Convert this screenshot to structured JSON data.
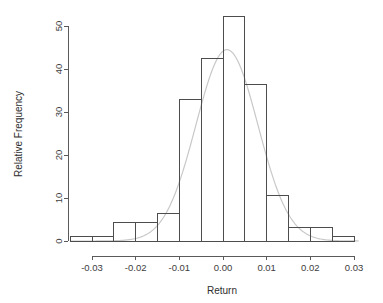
{
  "chart_data": {
    "type": "bar",
    "title": "",
    "subtitle": "",
    "xlabel": "Return",
    "ylabel": "Relative Frequency",
    "xlim": [
      -0.035,
      0.031
    ],
    "ylim": [
      0,
      52.5
    ],
    "grid": false,
    "legend": "none",
    "x_ticks": [
      -0.03,
      -0.02,
      -0.01,
      0.0,
      0.01,
      0.02,
      0.03
    ],
    "x_tick_labels": [
      "-0.03",
      "-0.02",
      "-0.01",
      "0.00",
      "0.01",
      "0.02",
      "0.03"
    ],
    "y_ticks": [
      0,
      10,
      20,
      30,
      40,
      50
    ],
    "y_tick_labels": [
      "0",
      "10",
      "20",
      "30",
      "40",
      "50"
    ],
    "bin_width": 0.005,
    "bin_edges": [
      -0.035,
      -0.03,
      -0.025,
      -0.02,
      -0.015,
      -0.01,
      -0.005,
      0.0,
      0.005,
      0.01,
      0.015,
      0.02,
      0.025,
      0.03
    ],
    "bin_centers": [
      -0.0325,
      -0.0275,
      -0.0225,
      -0.0175,
      -0.0125,
      -0.0075,
      -0.0025,
      0.0025,
      0.0075,
      0.0125,
      0.0175,
      0.0225,
      0.0275
    ],
    "values": [
      1.0,
      1.0,
      4.3,
      4.3,
      6.5,
      33.0,
      42.5,
      52.2,
      36.5,
      10.6,
      3.1,
      3.1,
      1.0
    ],
    "categories": [
      "-0.0325",
      "-0.0275",
      "-0.0225",
      "-0.0175",
      "-0.0125",
      "-0.0075",
      "-0.0025",
      "0.0025",
      "0.0075",
      "0.0125",
      "0.0175",
      "0.0225",
      "0.0275"
    ],
    "overlay": {
      "type": "line",
      "name": "normal density",
      "mean": 0.0009,
      "sd": 0.0071,
      "peak_value": 44.5,
      "color": "#c8c8c8"
    },
    "bar_stroke_color": "#4d4d4d",
    "bar_fill_color": "none",
    "axis_color": "#5a5a5a"
  },
  "axes": {
    "x_title": "Return",
    "y_title": "Relative Frequency"
  }
}
